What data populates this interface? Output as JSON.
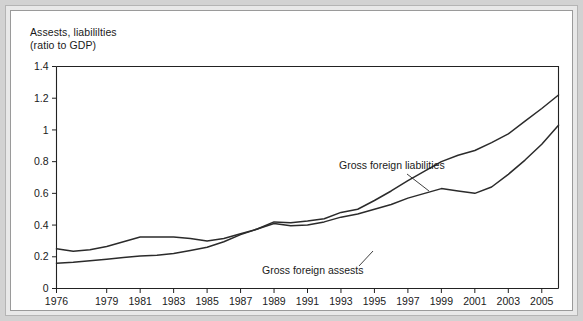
{
  "figure": {
    "background_color": "#d2d2d2",
    "panel_color": "#ffffff",
    "frame_color": "#9a9a9a"
  },
  "chart_data": {
    "type": "line",
    "title_line1": "Assests, liabililties",
    "title_line2": "(ratio to GDP)",
    "xlabel": "",
    "ylabel": "",
    "ylim": [
      0,
      1.4
    ],
    "xlim": [
      1976,
      2006
    ],
    "grid": false,
    "legend": "inline-annotations",
    "ytick_labels": [
      "0",
      "0.2",
      "0.4",
      "0.6",
      "0.8",
      "1",
      "1.2",
      "1.4"
    ],
    "ytick_values": [
      0,
      0.2,
      0.4,
      0.6,
      0.8,
      1,
      1.2,
      1.4
    ],
    "xtick_labels": [
      "1976",
      "1979",
      "1981",
      "1983",
      "1985",
      "1987",
      "1989",
      "1991",
      "1993",
      "1995",
      "1997",
      "1999",
      "2001",
      "2003",
      "2005"
    ],
    "xtick_values": [
      1976,
      1979,
      1981,
      1983,
      1985,
      1987,
      1989,
      1991,
      1993,
      1995,
      1997,
      1999,
      2001,
      2003,
      2005
    ],
    "x": [
      1976,
      1977,
      1978,
      1979,
      1980,
      1981,
      1982,
      1983,
      1984,
      1985,
      1986,
      1987,
      1988,
      1989,
      1990,
      1991,
      1992,
      1993,
      1994,
      1995,
      1996,
      1997,
      1998,
      1999,
      2000,
      2001,
      2002,
      2003,
      2004,
      2005,
      2006
    ],
    "series": [
      {
        "name": "Gross foreign liabilities",
        "color": "#2b2b2b",
        "values": [
          0.25,
          0.235,
          0.245,
          0.265,
          0.295,
          0.325,
          0.325,
          0.325,
          0.315,
          0.3,
          0.315,
          0.345,
          0.375,
          0.42,
          0.415,
          0.425,
          0.44,
          0.48,
          0.5,
          0.555,
          0.615,
          0.68,
          0.74,
          0.8,
          0.84,
          0.87,
          0.92,
          0.975,
          1.055,
          1.135,
          1.22
        ]
      },
      {
        "name": "Gross foreign assests",
        "color": "#2b2b2b",
        "values": [
          0.16,
          0.165,
          0.175,
          0.185,
          0.195,
          0.205,
          0.21,
          0.22,
          0.24,
          0.26,
          0.295,
          0.34,
          0.375,
          0.41,
          0.395,
          0.4,
          0.42,
          0.45,
          0.47,
          0.5,
          0.53,
          0.57,
          0.6,
          0.63,
          0.615,
          0.6,
          0.64,
          0.72,
          0.81,
          0.91,
          1.03
        ]
      }
    ],
    "annotations": [
      {
        "name": "liabilities-annotation",
        "text": "Gross foreign liabilities",
        "text_x": 328,
        "text_y": 158,
        "leader_from_x": 396,
        "leader_from_y": 163,
        "leader_to_x": 418,
        "leader_to_y": 180
      },
      {
        "name": "assets-annotation",
        "text": "Gross foreign assests",
        "text_x": 251,
        "text_y": 263,
        "leader_from_x": 348,
        "leader_from_y": 255,
        "leader_to_x": 362,
        "leader_to_y": 240
      }
    ]
  }
}
